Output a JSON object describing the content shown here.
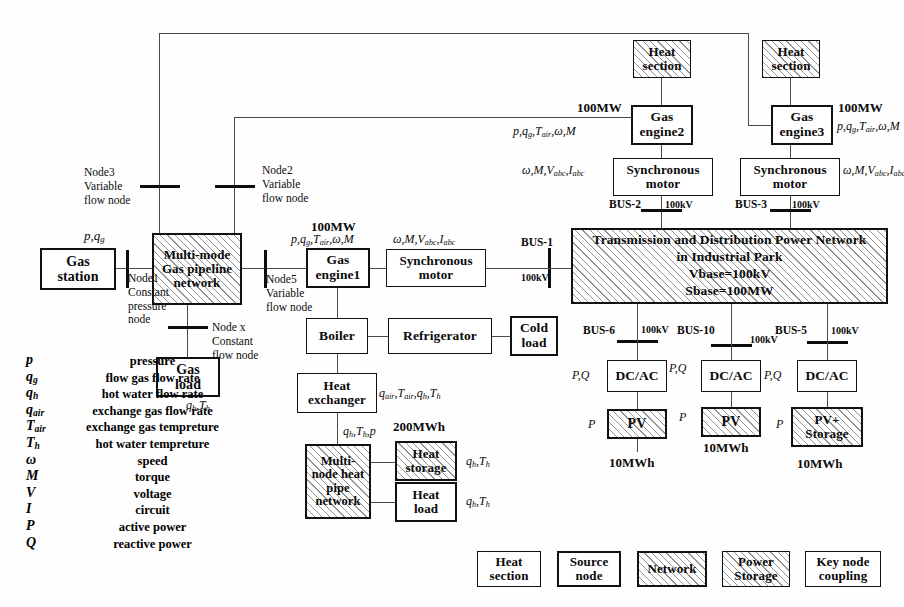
{
  "diagram": {
    "blocks": {
      "gas_station": "Gas\nstation",
      "gas_pipeline": "Multi-mode\nGas pipeline\nnetwork",
      "gas_load": "Gas\nload",
      "gas_engine1": "Gas\nengine1",
      "gas_engine2": "Gas\nengine2",
      "gas_engine3": "Gas\nengine3",
      "sync_motor1": "Synchronous\nmotor",
      "sync_motor2": "Synchronous\nmotor",
      "sync_motor3": "Synchronous\nmotor",
      "heat_section2": "Heat\nsection",
      "heat_section3": "Heat\nsection",
      "boiler": "Boiler",
      "refrigerator": "Refrigerator",
      "cold_load": "Cold\nload",
      "heat_exchanger": "Heat\nexchanger",
      "heat_pipe": "Multi-\nnode heat\npipe\nnetwork",
      "heat_storage": "Heat\nstorage",
      "heat_load": "Heat\nload",
      "tdpn": "Transmission and Distribution Power Network\nin Industrial Park\nVbase=100kV\nSbase=100MW",
      "dcac1": "DC/AC",
      "dcac2": "DC/AC",
      "dcac3": "DC/AC",
      "pv1": "PV",
      "pv2": "PV",
      "pv3": "PV+\nStorage"
    },
    "nodes": {
      "node1": "Node1\nConstant\npressure\nnode",
      "node2": "Node2\nVariable\nflow node",
      "node3": "Node3\nVariable\nflow node",
      "node5": "Node5\nVariable\nflow node",
      "nodex": "Node x\nConstant\nflow node"
    },
    "buses": {
      "bus1": "BUS-1",
      "bus2": "BUS-2",
      "bus3": "BUS-3",
      "bus5": "BUS-5",
      "bus6": "BUS-6",
      "bus10": "BUS-10"
    },
    "ratings": {
      "kv1": "100kV",
      "kv2": "100kV",
      "kv3": "100kV",
      "kv5": "100kV",
      "kv6": "100kV",
      "kv10": "100kV",
      "mw_engine1": "100MW",
      "mw_engine2": "100MW",
      "mw_engine3": "100MW",
      "mwh_heat_storage": "200MWh",
      "mwh_pv1": "10MWh",
      "mwh_pv2": "10MWh",
      "mwh_pv3": "10MWh"
    },
    "flow_labels": {
      "gas_station_out": "p , q_g",
      "engine1_in": "p , q_g , T_air , w , M",
      "engine2_in": "p , q_g , T_air , w , M",
      "engine3_in": "p , q_g , T_air , w , M",
      "motor1_in": "w , M , V_abc , I_abc",
      "motor2_in": "w , M , V_abc , I_abc",
      "motor3_in": "w , M , V_abc , I_abc",
      "gas_load_out": "q_h , T_h",
      "heat_exchanger_out": "q_air , T_air , q_h , T_h",
      "heat_pipe_in": "q_h , T_h , p",
      "heat_storage_out": "q_h , T_h",
      "heat_load_out": "q_h , T_h",
      "pq1": "P , Q",
      "pq2": "P , Q",
      "pq3": "P , Q",
      "p1": "P",
      "p2": "P",
      "p3": "P"
    },
    "nomenclature": [
      {
        "symbol": "p",
        "sub": "",
        "desc": "pressure"
      },
      {
        "symbol": "q",
        "sub": "g",
        "desc": "flow gas flow rate"
      },
      {
        "symbol": "q",
        "sub": "h",
        "desc": "hot water flow rate"
      },
      {
        "symbol": "q",
        "sub": "air",
        "desc": "exchange gas flow rate"
      },
      {
        "symbol": "T",
        "sub": "air",
        "desc": "exchange gas tempreture"
      },
      {
        "symbol": "T",
        "sub": "h",
        "desc": "hot water tempreture"
      },
      {
        "symbol": "ω",
        "sub": "",
        "desc": "speed"
      },
      {
        "symbol": "M",
        "sub": "",
        "desc": "torque"
      },
      {
        "symbol": "V",
        "sub": "",
        "desc": "voltage"
      },
      {
        "symbol": "I",
        "sub": "",
        "desc": "circuit"
      },
      {
        "symbol": "P",
        "sub": "",
        "desc": "active power"
      },
      {
        "symbol": "Q",
        "sub": "",
        "desc": "reactive power"
      }
    ],
    "key_legend": [
      {
        "label": "Heat\nsection",
        "style": "plain-thin"
      },
      {
        "label": "Source\nnode",
        "style": "plain-thick"
      },
      {
        "label": "Network",
        "style": "hatch-thick"
      },
      {
        "label": "Power\nStorage",
        "style": "hatch-thin"
      },
      {
        "label": "Key node\ncoupling",
        "style": "plain-thin"
      }
    ],
    "colors": {
      "ink": "#0b0b0b",
      "wire": "#4a4a4a",
      "bus": "#0d0d0d",
      "paper": "#fefefe"
    }
  }
}
